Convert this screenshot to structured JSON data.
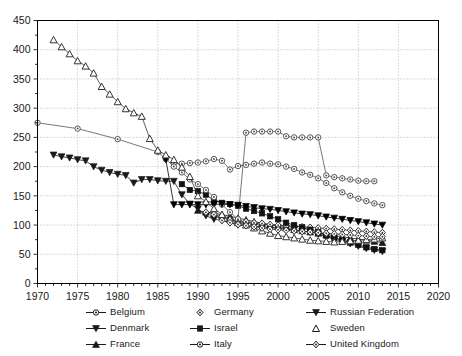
{
  "chart_data": {
    "type": "line",
    "title": "",
    "xlabel": "",
    "ylabel": "",
    "xlim": [
      1970,
      2020
    ],
    "ylim": [
      0,
      450
    ],
    "xticks": [
      1970,
      1975,
      1980,
      1985,
      1990,
      1995,
      2000,
      2005,
      2010,
      2015,
      2020
    ],
    "yticks": [
      0,
      50,
      100,
      150,
      200,
      250,
      300,
      350,
      400,
      450
    ],
    "minor_x_tick_interval": 1,
    "grid": true,
    "grid_style": "dotted",
    "legend_position": "below-plot",
    "legend_columns": 3,
    "series": [
      {
        "name": "Belgium",
        "marker": "circle-open-dot",
        "color": "#555555",
        "x": [
          1987,
          1988,
          1989,
          1990,
          1991,
          1992,
          1993,
          1994,
          1995,
          1996,
          1997,
          1998,
          1999,
          2000,
          2001,
          2002,
          2003,
          2004,
          2005,
          2006,
          2007,
          2008,
          2009,
          2010,
          2011,
          2012,
          2013
        ],
        "y": [
          206,
          205,
          206,
          207,
          209,
          213,
          210,
          195,
          201,
          203,
          205,
          207,
          205,
          204,
          200,
          196,
          190,
          186,
          180,
          172,
          163,
          156,
          150,
          145,
          141,
          137,
          134
        ]
      },
      {
        "name": "Denmark",
        "marker": "triangle-down-filled",
        "color": "#1a1a1a",
        "x": [
          1972,
          1973,
          1974,
          1975,
          1976,
          1977,
          1978,
          1979,
          1980,
          1981,
          1982,
          1983,
          1984,
          1985,
          1986,
          1987,
          1988,
          1989,
          1990,
          1991,
          1992,
          1993,
          1994,
          1995,
          1996,
          1997,
          1998,
          1999,
          2000,
          2001,
          2002,
          2003,
          2004,
          2005,
          2006,
          2007,
          2008,
          2009,
          2010,
          2011,
          2012,
          2013
        ],
        "y": [
          220,
          217,
          215,
          212,
          210,
          200,
          194,
          190,
          187,
          185,
          172,
          178,
          178,
          176,
          175,
          175,
          152,
          136,
          128,
          116,
          110,
          108,
          104,
          100,
          99,
          98,
          97,
          96,
          95,
          93,
          92,
          90,
          88,
          85,
          80,
          76,
          72,
          68,
          64,
          60,
          57,
          55
        ]
      },
      {
        "name": "France",
        "marker": "triangle-up-filled",
        "color": "#1a1a1a",
        "x": [
          1990,
          1991,
          1992,
          1993,
          1994,
          1995,
          1996,
          1997,
          1998,
          1999,
          2000,
          2001,
          2002,
          2003,
          2004,
          2005,
          2006,
          2007,
          2008,
          2009,
          2010,
          2011,
          2012,
          2013
        ],
        "y": [
          125,
          122,
          120,
          118,
          115,
          112,
          109,
          106,
          103,
          100,
          98,
          95,
          92,
          90,
          88,
          86,
          84,
          82,
          80,
          78,
          76,
          74,
          72,
          70
        ]
      },
      {
        "name": "Germany",
        "marker": "diamond-open",
        "color": "#333333",
        "x": [
          1991,
          1992,
          1993,
          1994,
          1995,
          1996,
          1997,
          1998,
          1999,
          2000,
          2001,
          2002,
          2003,
          2004,
          2005,
          2006,
          2007,
          2008,
          2009,
          2010,
          2011,
          2012,
          2013
        ],
        "y": [
          122,
          120,
          113,
          110,
          107,
          106,
          104,
          103,
          101,
          100,
          99,
          98,
          97,
          96,
          95,
          94,
          93,
          92,
          91,
          90,
          89,
          88,
          87
        ]
      },
      {
        "name": "Israel",
        "marker": "square-filled",
        "color": "#111111",
        "x": [
          1988,
          1989,
          1990,
          1991,
          1992,
          1993,
          1994,
          1995,
          1996,
          1997,
          1998,
          1999,
          2000,
          2001,
          2002,
          2003,
          2004,
          2005,
          2006,
          2007,
          2008,
          2009,
          2010,
          2011,
          2012,
          2013
        ],
        "y": [
          170,
          160,
          158,
          152,
          142,
          138,
          136,
          133,
          128,
          124,
          120,
          115,
          110,
          104,
          100,
          96,
          92,
          88,
          82,
          78,
          74,
          70,
          66,
          62,
          59,
          57
        ]
      },
      {
        "name": "Italy",
        "marker": "circle-open-dot",
        "color": "#555555",
        "x": [
          1970,
          1975,
          1980,
          1985,
          1986,
          1987,
          1988,
          1989,
          1990,
          1991,
          1992,
          1993,
          1994,
          1995,
          1996,
          1997,
          1998,
          1999,
          2000,
          2001,
          2002,
          2003,
          2004,
          2005,
          2006,
          2007,
          2008,
          2009,
          2010,
          2011,
          2012
        ],
        "y": [
          275,
          265,
          247,
          225,
          213,
          200,
          190,
          178,
          170,
          160,
          148,
          135,
          122,
          110,
          258,
          260,
          260,
          260,
          260,
          252,
          250,
          250,
          250,
          250,
          185,
          182,
          180,
          178,
          176,
          175,
          175
        ]
      },
      {
        "name": "Russian Federation",
        "marker": "triangle-down-filled",
        "color": "#000000",
        "x": [
          1986,
          1987,
          1988,
          1989,
          1990,
          1991,
          1992,
          1993,
          1994,
          1995,
          1996,
          1997,
          1998,
          1999,
          2000,
          2001,
          2002,
          2003,
          2004,
          2005,
          2006,
          2007,
          2008,
          2009,
          2010,
          2011,
          2012,
          2013
        ],
        "y": [
          212,
          135,
          135,
          135,
          135,
          135,
          135,
          136,
          135,
          134,
          132,
          130,
          128,
          127,
          125,
          123,
          121,
          119,
          118,
          116,
          114,
          112,
          110,
          108,
          106,
          104,
          102,
          100
        ]
      },
      {
        "name": "Sweden",
        "marker": "triangle-up-open",
        "color": "#333333",
        "x": [
          1972,
          1973,
          1974,
          1975,
          1976,
          1977,
          1978,
          1979,
          1980,
          1981,
          1982,
          1983,
          1984,
          1985,
          1986,
          1987,
          1988,
          1989,
          1990,
          1991,
          1992,
          1993,
          1994,
          1995,
          1996,
          1997,
          1998,
          1999,
          2000,
          2001,
          2002,
          2003,
          2004,
          2005,
          2006,
          2007,
          2008,
          2009,
          2010,
          2011,
          2012,
          2013
        ],
        "y": [
          417,
          405,
          393,
          381,
          372,
          360,
          337,
          324,
          311,
          299,
          292,
          286,
          248,
          228,
          220,
          212,
          199,
          183,
          150,
          140,
          128,
          118,
          110,
          104,
          100,
          95,
          90,
          86,
          82,
          80,
          78,
          76,
          74,
          73,
          72,
          71,
          72,
          73,
          74,
          75,
          76,
          78
        ]
      },
      {
        "name": "United Kingdom",
        "marker": "diamond-open",
        "color": "#333333",
        "x": [
          1992,
          1993,
          1994,
          1995,
          1996,
          1997,
          1998,
          1999,
          2000,
          2001,
          2002,
          2003,
          2004,
          2005,
          2006,
          2007,
          2008,
          2009,
          2010,
          2011,
          2012,
          2013
        ],
        "y": [
          118,
          108,
          104,
          101,
          99,
          97,
          95,
          93,
          92,
          91,
          90,
          89,
          88,
          87,
          86,
          85,
          84,
          83,
          82,
          81,
          80,
          80
        ]
      }
    ]
  },
  "legend": {
    "items": [
      {
        "label": "Belgium",
        "marker": "circle-open-dot",
        "line": true
      },
      {
        "label": "Germany",
        "marker": "diamond-open",
        "line": false
      },
      {
        "label": "Russian Federation",
        "marker": "triangle-down-filled",
        "line": true
      },
      {
        "label": "Denmark",
        "marker": "triangle-down-filled",
        "line": true
      },
      {
        "label": "Israel",
        "marker": "square-filled",
        "line": true
      },
      {
        "label": "Sweden",
        "marker": "triangle-up-open",
        "line": false
      },
      {
        "label": "France",
        "marker": "triangle-up-filled",
        "line": true
      },
      {
        "label": "Italy",
        "marker": "circle-open-dot",
        "line": true
      },
      {
        "label": "United Kingdom",
        "marker": "diamond-open",
        "line": true
      }
    ]
  },
  "axes": {
    "x_tick_labels": [
      "1970",
      "1975",
      "1980",
      "1985",
      "1990",
      "1995",
      "2000",
      "2005",
      "2010",
      "2015",
      "2020"
    ],
    "y_tick_labels": [
      "0",
      "50",
      "100",
      "150",
      "200",
      "250",
      "300",
      "350",
      "400",
      "450"
    ]
  },
  "colors": {
    "axis": "#000000",
    "grid": "#9a9a9a",
    "background": "#ffffff",
    "text": "#1a1a1a"
  }
}
